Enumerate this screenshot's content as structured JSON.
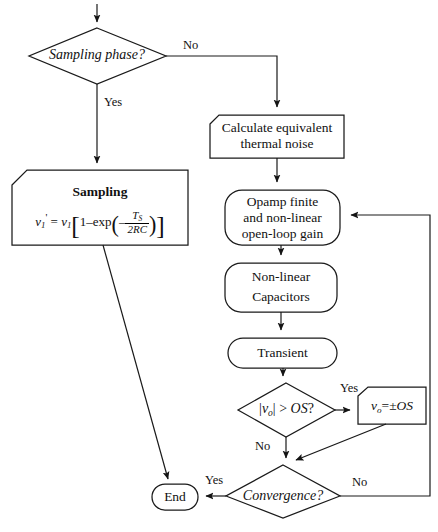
{
  "diagram": {
    "stroke_color": "#1a1a1a",
    "fill_color": "#ffffff"
  },
  "nodes": {
    "sampling_phase": {
      "label": "Sampling phase?",
      "shape": "diamond"
    },
    "calculate_noise": {
      "line1": "Calculate equivalent",
      "line2": "thermal noise",
      "shape": "cut-corner-box"
    },
    "sampling_box": {
      "title": "Sampling",
      "formula_plain": "v1' = v1[1 - exp(-TS/(2RC))]",
      "formula": {
        "lhs_var": "v",
        "lhs_sub": "1",
        "lhs_prime": "'",
        "equals": "=",
        "rhs_var": "v",
        "rhs_sub": "1",
        "bracket_open": "[",
        "one": "1",
        "minus": "–",
        "exp": "exp",
        "paren_open": "(",
        "neg": "–",
        "num": "T",
        "num_sub": "S",
        "den": "2RC",
        "paren_close": ")",
        "bracket_close": "]"
      },
      "shape": "cut-corner-box"
    },
    "opamp": {
      "line1": "Opamp finite",
      "line2": "and non-linear",
      "line3": "open-loop gain",
      "shape": "rounded-box"
    },
    "nonlinear_caps": {
      "line1": "Non-linear",
      "line2": "Capacitors",
      "shape": "rounded-box"
    },
    "transient": {
      "label": "Transient",
      "shape": "rounded-box"
    },
    "overshoot_test": {
      "label_plain": "|vo| > OS?",
      "parts": {
        "bar_open": "|",
        "v": "v",
        "sub": "o",
        "bar_close": "|",
        "gt": ">",
        "os": "OS",
        "q": "?"
      },
      "shape": "diamond"
    },
    "clamp": {
      "label_plain": "vo=±OS",
      "parts": {
        "v": "v",
        "sub": "o",
        "eq": "=±",
        "os": "OS"
      },
      "shape": "cut-corner-box"
    },
    "convergence": {
      "label": "Convergence?",
      "shape": "diamond"
    },
    "end": {
      "label": "End",
      "shape": "stadium"
    }
  },
  "edge_labels": {
    "sampling_no": "No",
    "sampling_yes": "Yes",
    "overshoot_yes": "Yes",
    "overshoot_no": "No",
    "convergence_yes": "Yes",
    "convergence_no": "No"
  }
}
